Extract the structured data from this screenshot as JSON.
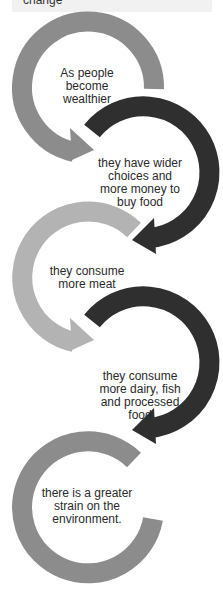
{
  "header": {
    "partial_title": "change"
  },
  "colors": {
    "medium": "#8c8c8c",
    "dark": "#2f2f2f",
    "light": "#b3b3b3",
    "text": "#2a2a2a"
  },
  "steps": [
    {
      "text": "As people become wealthier",
      "lines": [
        "As people",
        "become",
        "wealthier"
      ],
      "ring_color": "medium"
    },
    {
      "text": "they have wider choices and more money to buy food",
      "lines": [
        "they have wider",
        "choices and",
        "more money to",
        "buy food"
      ],
      "ring_color": "dark"
    },
    {
      "text": "they consume more meat",
      "lines": [
        "they consume",
        "more meat"
      ],
      "ring_color": "light"
    },
    {
      "text": "they consume more dairy, fish and processed food",
      "lines": [
        "they consume",
        "more dairy, fish",
        "and processed",
        "food"
      ],
      "ring_color": "dark"
    },
    {
      "text": "there is a greater strain on the environment.",
      "lines": [
        "there is a greater",
        "strain on the",
        "environment."
      ],
      "ring_color": "medium"
    }
  ]
}
